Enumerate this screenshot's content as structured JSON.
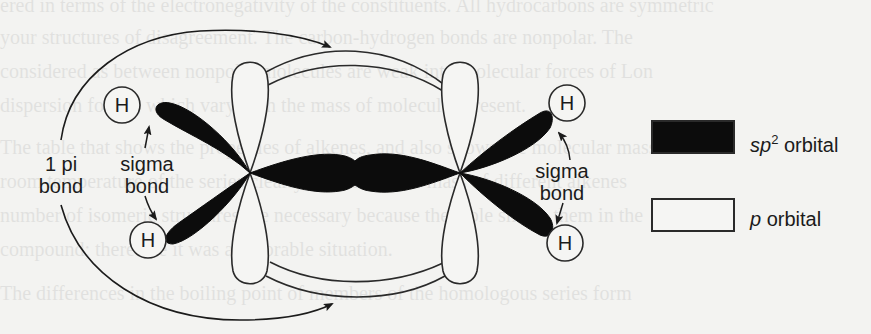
{
  "background_text": {
    "lines": [
      "ered in terms of the electronegativity of the constituents. All hydrocarbons are symmetric",
      "your structures of disagreement. The carbon-hydrogen bonds are nonpolar. The",
      "considered as between nonpolar molecules are weak intermolecular forces of Lon",
      "dispersion forces, which vary with the mass of molecules present.",
      "The table that shows the properties of alkenes, and also shows the molecular mass",
      "room temperature of the series clearly, the molecular mass of different alkenes",
      "number of isomeric structures are necessary because the table shows them in the",
      "compound; therefore it was a favorable situation.",
      "The differences in the boiling point of members of the homologous series form"
    ]
  },
  "diagram": {
    "atoms": {
      "hydrogen_symbol": "H",
      "hydrogens": [
        {
          "id": "h-top-left",
          "cx": 122,
          "cy": 105
        },
        {
          "id": "h-bottom-left",
          "cx": 148,
          "cy": 240
        },
        {
          "id": "h-top-right",
          "cx": 567,
          "cy": 103
        },
        {
          "id": "h-bottom-right",
          "cx": 565,
          "cy": 243
        }
      ],
      "carbons": [
        {
          "id": "c-left",
          "cx": 250,
          "cy": 173
        },
        {
          "id": "c-right",
          "cx": 460,
          "cy": 173
        }
      ]
    },
    "labels": {
      "pi_bond_line1": "1 pi",
      "pi_bond_line2": "bond",
      "sigma_left_line1": "sigma",
      "sigma_left_line2": "bond",
      "sigma_right_line1": "sigma",
      "sigma_right_line2": "bond"
    },
    "colors": {
      "sp2_fill": "#0c0c0c",
      "p_fill": "#f5f5f3",
      "stroke": "#2a2a2a",
      "background": "#f3f3f1"
    }
  },
  "legend": {
    "items": [
      {
        "id": "sp2",
        "prefix": "sp",
        "superscript": "2",
        "suffix": " orbital",
        "fill": "#0c0c0c"
      },
      {
        "id": "p",
        "prefix": "p",
        "superscript": "",
        "suffix": " orbital",
        "fill": "#f5f5f3"
      }
    ]
  }
}
